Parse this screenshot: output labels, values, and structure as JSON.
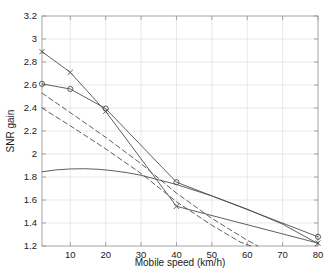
{
  "chart_data": {
    "type": "line",
    "title": "",
    "xlabel": "Mobile speed (km/h)",
    "ylabel": "SNR gain",
    "xlim": [
      2,
      80
    ],
    "ylim": [
      1.2,
      3.2
    ],
    "xticks": [
      10,
      20,
      30,
      40,
      50,
      60,
      70,
      80
    ],
    "xtick_labels": [
      "10",
      "20",
      "30",
      "40",
      "50",
      "60",
      "70",
      "80"
    ],
    "yticks": [
      1.2,
      1.4,
      1.6,
      1.8,
      2.0,
      2.2,
      2.4,
      2.6,
      2.8,
      3.0,
      3.2
    ],
    "ytick_labels": [
      "1.2",
      "1.4",
      "1.6",
      "1.8",
      "2",
      "2.2",
      "2.4",
      "2.6",
      "2.8",
      "3",
      "3.2"
    ],
    "grid": true,
    "legend": "none",
    "line_color": "#4d4d4d",
    "grid_color": "#d9d9d9",
    "axis_color": "#9a9a9a",
    "series": [
      {
        "name": "solid-x-marker",
        "style": "solid",
        "marker": "x",
        "x": [
          2,
          10,
          20,
          40,
          80
        ],
        "values": [
          2.89,
          2.71,
          2.37,
          1.545,
          1.225
        ]
      },
      {
        "name": "solid-circle-marker",
        "style": "solid",
        "marker": "o",
        "x": [
          2,
          10,
          20,
          40,
          80
        ],
        "values": [
          2.61,
          2.565,
          2.395,
          1.755,
          1.28
        ]
      },
      {
        "name": "dashed-upper",
        "style": "dashed",
        "marker": "none",
        "x": [
          2,
          10,
          20,
          30,
          40,
          50,
          60,
          63
        ],
        "values": [
          2.53,
          2.36,
          2.145,
          1.915,
          1.66,
          1.44,
          1.25,
          1.2
        ]
      },
      {
        "name": "dashed-lower",
        "style": "dashed",
        "marker": "none",
        "x": [
          2,
          10,
          20,
          30,
          40,
          50,
          58,
          61
        ],
        "values": [
          2.4,
          2.245,
          2.045,
          1.83,
          1.585,
          1.38,
          1.235,
          1.2
        ]
      },
      {
        "name": "solid-flat",
        "style": "solid",
        "marker": "none",
        "x": [
          2,
          6,
          10,
          14,
          18,
          22,
          26,
          30,
          40,
          50,
          60,
          70,
          80
        ],
        "values": [
          1.845,
          1.862,
          1.87,
          1.872,
          1.867,
          1.855,
          1.838,
          1.815,
          1.735,
          1.635,
          1.52,
          1.39,
          1.22
        ]
      }
    ]
  }
}
